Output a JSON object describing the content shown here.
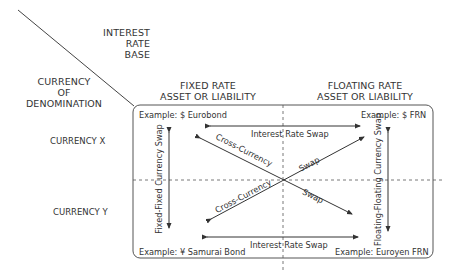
{
  "axes": {
    "interest_rate_base": [
      "INTEREST",
      "RATE",
      "BASE"
    ],
    "currency_of_denomination": [
      "CURRENCY",
      "OF",
      "DENOMINATION"
    ]
  },
  "columns": {
    "fixed": [
      "FIXED RATE",
      "ASSET OR LIABILITY"
    ],
    "floating": [
      "FLOATING RATE",
      "ASSET OR LIABILITY"
    ]
  },
  "rows": {
    "currency_x": "CURRENCY X",
    "currency_y": "CURRENCY Y"
  },
  "examples": {
    "top_left": "Example: $ Eurobond",
    "top_right": "Example: $ FRN",
    "bottom_left": "Example: ¥ Samurai Bond",
    "bottom_right": "Example: Euroyen FRN"
  },
  "swaps": {
    "interest_rate_top": "Interest Rate Swap",
    "interest_rate_bottom": "Interest Rate Swap",
    "fixed_fixed": "Fixed-Fixed Currency Swap",
    "floating_floating": "Floating-Floating Currency Swap",
    "cross_currency_upper": "Cross-Currency",
    "cross_currency_lower": "Cross-Currency",
    "swap_upper": "Swap",
    "swap_lower": "Swap"
  },
  "colors": {
    "line": "#333333",
    "text": "#333333",
    "box_border": "#555555"
  }
}
